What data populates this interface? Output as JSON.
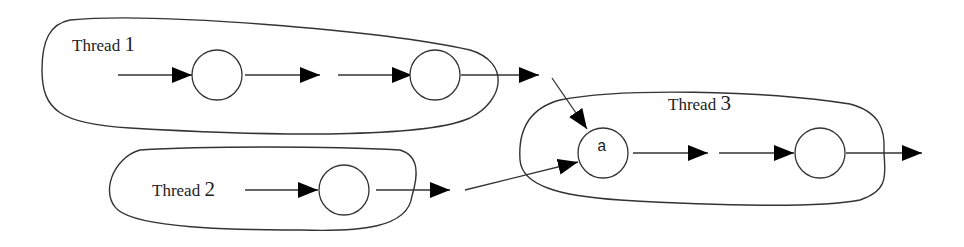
{
  "diagram": {
    "type": "thread-flow",
    "threads": [
      {
        "id": "thread-1",
        "label_word": "Thread",
        "label_num": "1",
        "nodes": [
          "",
          ""
        ]
      },
      {
        "id": "thread-2",
        "label_word": "Thread",
        "label_num": "2",
        "nodes": [
          ""
        ]
      },
      {
        "id": "thread-3",
        "label_word": "Thread",
        "label_num": "3",
        "nodes": [
          "a",
          ""
        ]
      }
    ],
    "edges": [
      {
        "from": "thread-1.out",
        "to": "thread-3.node-a"
      },
      {
        "from": "thread-2.out",
        "to": "thread-3.node-a"
      }
    ],
    "colors": {
      "stroke": "#333333",
      "arrowhead": "#000000",
      "background": "#ffffff"
    }
  }
}
